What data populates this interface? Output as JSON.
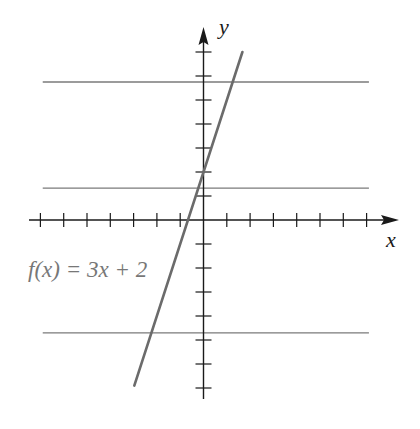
{
  "chart_data": {
    "type": "line",
    "title": "",
    "xlabel": "x",
    "ylabel": "y",
    "xlim": [
      -7.5,
      8.4
    ],
    "ylim": [
      -7.4,
      8.0
    ],
    "grid": false,
    "x_ticks": [
      -7,
      -6,
      -5,
      -4,
      -3,
      -2,
      -1,
      1,
      2,
      3,
      4,
      5,
      6,
      7
    ],
    "y_ticks": [
      -7,
      -6,
      -5,
      -4,
      -3,
      -2,
      -1,
      1,
      2,
      3,
      4,
      5,
      6,
      7
    ],
    "tick_labels_shown": false,
    "series": [
      {
        "name": "f(x) = 3x + 2",
        "equation": "f(x) = 3x + 2",
        "slope": 3,
        "intercept": 2,
        "x": [
          -2.97,
          1.67
        ],
        "y": [
          -6.9,
          7.0
        ],
        "color": "#6b6b6b"
      }
    ],
    "horizontal_lines": [
      {
        "y": 5.75,
        "x_range": [
          -6.9,
          7.1
        ],
        "color": "#7a7a7a"
      },
      {
        "y": 1.33,
        "x_range": [
          -6.9,
          7.1
        ],
        "color": "#7a7a7a"
      },
      {
        "y": -4.7,
        "x_range": [
          -6.9,
          7.1
        ],
        "color": "#7a7a7a"
      }
    ],
    "annotations": [
      {
        "text": "f(x) = 3x + 2",
        "position": "left of line, below x-axis"
      }
    ],
    "legend": null
  },
  "labels": {
    "x_axis": "x",
    "y_axis": "y",
    "function_label": "f(x) = 3x + 2"
  },
  "colors": {
    "axis": "#1a1a1a",
    "function_line": "#6b6b6b",
    "horizontal_lines": "#7a7a7a",
    "label_text": "#777777",
    "background": "#ffffff"
  }
}
